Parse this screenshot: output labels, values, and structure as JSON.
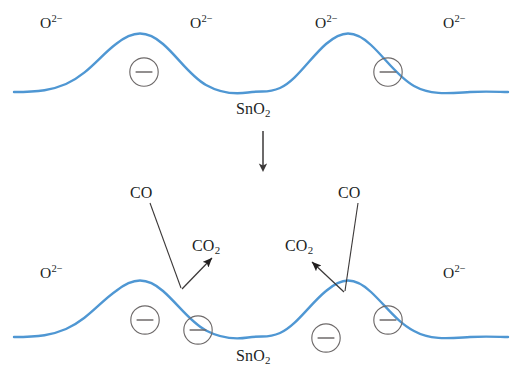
{
  "figure": {
    "background_color": "#ffffff",
    "curve_color": "#4f97d3",
    "ink_color": "#221f1f",
    "charge_circle_color": "#6e6a6a"
  },
  "panels": {
    "top": {
      "name": "clean-surface-panel",
      "surface_label": "SnO2",
      "surface_label_html": "SnO<sub>2</sub>",
      "oxygen_labels": [
        {
          "text_html": "O<sup>2−</sup>",
          "text": "O2−",
          "x": 55,
          "y": 22
        },
        {
          "text_html": "O<sup>2−</sup>",
          "text": "O2−",
          "x": 205,
          "y": 22
        },
        {
          "text_html": "O<sup>2−</sup>",
          "text": "O2−",
          "x": 330,
          "y": 22
        },
        {
          "text_html": "O<sup>2−</sup>",
          "text": "O2−",
          "x": 458,
          "y": 22
        }
      ],
      "electron_charges": [
        {
          "symbol": "⊖",
          "x": 144,
          "y": 72
        },
        {
          "symbol": "⊖",
          "x": 388,
          "y": 72
        }
      ],
      "electron_count": 2
    },
    "transition": {
      "name": "reaction-arrow",
      "direction": "down"
    },
    "bottom": {
      "name": "co-exposed-surface-panel",
      "surface_label": "SnO2",
      "surface_label_html": "SnO<sub>2</sub>",
      "oxygen_labels": [
        {
          "text_html": "O<sup>2−</sup>",
          "text": "O2−",
          "x": 55,
          "y": 272
        },
        {
          "text_html": "O<sup>2−</sup>",
          "text": "O2−",
          "x": 458,
          "y": 272
        }
      ],
      "reactant_labels": [
        {
          "text": "CO",
          "x": 147,
          "y": 193
        },
        {
          "text": "CO",
          "x": 355,
          "y": 193
        }
      ],
      "product_labels": [
        {
          "text_html": "CO<sub>2</sub>",
          "text": "CO2",
          "x": 214,
          "y": 246
        },
        {
          "text_html": "CO<sub>2</sub>",
          "text": "CO2",
          "x": 307,
          "y": 246
        }
      ],
      "electron_charges": [
        {
          "symbol": "⊖",
          "x": 145,
          "y": 320
        },
        {
          "symbol": "⊖",
          "x": 198,
          "y": 330
        },
        {
          "symbol": "⊖",
          "x": 326,
          "y": 338
        },
        {
          "symbol": "⊖",
          "x": 388,
          "y": 320
        }
      ],
      "electron_count": 4
    }
  },
  "chart_data": {
    "type": "line",
    "xlabel": "",
    "ylabel": "",
    "grid": false,
    "legend": null,
    "series": [
      {
        "name": "top-surface-profile",
        "comment": "Two symmetric humps representing SnO2 grain surface with adsorbed O2-",
        "x": [
          14,
          60,
          100,
          140,
          180,
          215,
          262,
          310,
          348,
          388,
          428,
          470,
          508
        ],
        "y": [
          92,
          88,
          62,
          34,
          40,
          68,
          92,
          68,
          40,
          34,
          62,
          88,
          92
        ]
      },
      {
        "name": "bottom-surface-profile",
        "comment": "Two symmetric humps after CO exposure, additional trapped electrons released",
        "x": [
          14,
          60,
          100,
          140,
          180,
          215,
          262,
          310,
          348,
          388,
          428,
          470,
          508
        ],
        "y": [
          337,
          333,
          308,
          281,
          286,
          312,
          337,
          312,
          286,
          281,
          308,
          333,
          337
        ]
      }
    ]
  }
}
